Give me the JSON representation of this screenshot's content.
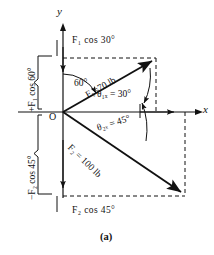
{
  "figure": {
    "caption": "(a)",
    "axes": {
      "x_label": "x",
      "y_label": "y",
      "origin_label": "O"
    },
    "vectors": [
      {
        "name": "F1",
        "label": "F₁=70 lb",
        "magnitude": 70,
        "unit": "lb",
        "direction_deg": 30,
        "quadrant": "upper-right",
        "angle_from_y_label": "60°",
        "angle_from_x_label": "θ₁ₓ = 30°",
        "component_x_label": "F₁ cos 30°",
        "component_y_label": "+F₁ cos 60°"
      },
      {
        "name": "F2",
        "label": "F₂ = 100 lb",
        "magnitude": 100,
        "unit": "lb",
        "direction_deg": -45,
        "quadrant": "lower-right",
        "angle_from_x_label": "θ₂ₓ = 45°",
        "component_x_label": "F₂ cos 45°",
        "component_y_label": "−F₂ cos 45°"
      }
    ],
    "labels": {
      "top_component": "F₁ cos 30°",
      "bottom_component": "F₂ cos 45°",
      "left_upper_brace": "+F₁ cos 60°",
      "left_lower_brace": "−F₂ cos 45°",
      "angle_60": "60°",
      "angle_theta1x": "θ₁ₓ = 30°",
      "angle_theta2x": "θ₂ₓ = 45°",
      "f1_vector": "F₁=70 lb",
      "f2_vector": "F₂ = 100 lb"
    },
    "colors": {
      "ink": "#111111",
      "paper": "#ffffff"
    }
  }
}
